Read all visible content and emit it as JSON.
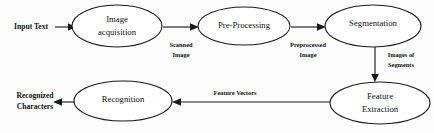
{
  "diagram": {
    "type": "flowchart",
    "stroke_color": "#1a1a1a",
    "background_color": "#fdfdfd",
    "nodes": [
      {
        "id": "image-acquisition",
        "label_line1": "Image",
        "label_line2": "acquisition",
        "cx": 117,
        "cy": 26,
        "rx": 45,
        "ry": 21
      },
      {
        "id": "pre-processing",
        "label_line1": "Pre-Processing",
        "label_line2": "",
        "cx": 244,
        "cy": 26,
        "rx": 46,
        "ry": 19
      },
      {
        "id": "segmentation",
        "label_line1": "Segmentation",
        "label_line2": "",
        "cx": 373,
        "cy": 26,
        "rx": 48,
        "ry": 21
      },
      {
        "id": "feature-extraction",
        "label_line1": "Feature",
        "label_line2": "Extraction",
        "cx": 380,
        "cy": 103,
        "rx": 50,
        "ry": 21
      },
      {
        "id": "recognition",
        "label_line1": "Recognition",
        "label_line2": "",
        "cx": 123,
        "cy": 101,
        "rx": 49,
        "ry": 20
      }
    ],
    "edge_labels": [
      {
        "id": "scanned-image",
        "line1": "Scanned",
        "line2": "Image",
        "x": 181,
        "y": 46
      },
      {
        "id": "preprocessed-image",
        "line1": "Preprocessed",
        "line2": "Image",
        "x": 308,
        "y": 46
      },
      {
        "id": "images-of-segments",
        "line1": "Images of",
        "line2": "Segments",
        "x": 400,
        "y": 56
      },
      {
        "id": "feature-vectors",
        "line1": "Feature Vectors",
        "line2": "",
        "x": 235,
        "y": 94
      }
    ],
    "io_labels": [
      {
        "id": "input-text",
        "line1": "Input Text",
        "line2": "",
        "x": 33,
        "y": 27
      },
      {
        "id": "recognized-characters",
        "line1": "Recognized",
        "line2": "Characters",
        "x": 36,
        "y": 97
      }
    ]
  }
}
